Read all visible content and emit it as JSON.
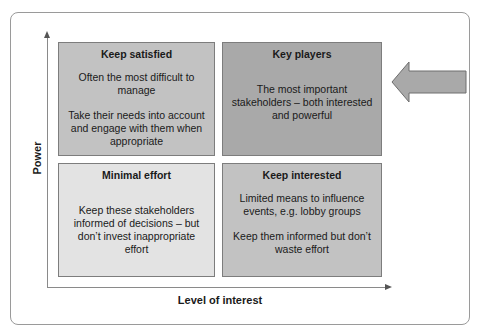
{
  "diagram": {
    "type": "stakeholder power-interest grid",
    "y_axis_label": "Power",
    "x_axis_label": "Level of interest",
    "quadrants": {
      "top_left": {
        "title": "Keep satisfied",
        "lines": [
          "Often the most difficult to manage",
          "Take their needs into account and engage with them when appropriate"
        ],
        "color": "#c2c2c2"
      },
      "top_right": {
        "title": "Key players",
        "lines": [
          "The most important stakeholders – both interested and powerful"
        ],
        "color": "#a9a9a9"
      },
      "bottom_left": {
        "title": "Minimal effort",
        "lines": [
          "Keep these stakeholders informed of decisions – but don’t invest inappropriate effort"
        ],
        "color": "#e3e3e3"
      },
      "bottom_right": {
        "title": "Keep interested",
        "lines": [
          "Limited means to influence events, e.g. lobby groups",
          "Keep them informed but don’t waste effort"
        ],
        "color": "#c2c2c2"
      }
    },
    "pointer_arrow": {
      "direction": "left",
      "target": "top_right",
      "color": "#a9a9a9"
    }
  }
}
